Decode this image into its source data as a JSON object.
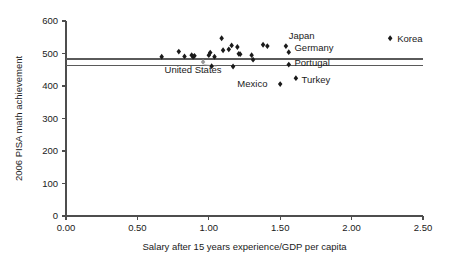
{
  "chart_data": {
    "type": "scatter",
    "title": "",
    "xlabel": "Salary after 15 years experience/GDP per capita",
    "ylabel": "2006 PISA math achievement",
    "xlim": [
      0.0,
      2.5
    ],
    "ylim": [
      0,
      600
    ],
    "grid": false,
    "legend_position": "top-right",
    "xticks": [
      "0.00",
      "0.50",
      "1.00",
      "1.50",
      "2.00",
      "2.50"
    ],
    "xtick_values": [
      0.0,
      0.5,
      1.0,
      1.5,
      2.0,
      2.5
    ],
    "yticks": [
      "0",
      "100",
      "200",
      "300",
      "400",
      "500",
      "600"
    ],
    "ytick_values": [
      0,
      100,
      200,
      300,
      400,
      500,
      600
    ],
    "legend": [
      {
        "name": "Korea",
        "x": 2.27,
        "y": 547
      }
    ],
    "reference_lines": [
      {
        "name": "oecd-average-upper",
        "value": 483
      },
      {
        "name": "oecd-average-lower",
        "value": 462
      }
    ],
    "points": [
      {
        "name": "point-1",
        "x": 0.67,
        "y": 490,
        "label": ""
      },
      {
        "name": "point-2",
        "x": 0.79,
        "y": 506,
        "label": ""
      },
      {
        "name": "point-3",
        "x": 0.83,
        "y": 491,
        "label": ""
      },
      {
        "name": "point-4",
        "x": 0.88,
        "y": 495,
        "label": ""
      },
      {
        "name": "point-5",
        "x": 0.89,
        "y": 490,
        "label": ""
      },
      {
        "name": "point-6",
        "x": 0.9,
        "y": 493,
        "label": ""
      },
      {
        "name": "point-7",
        "x": 0.96,
        "y": 474,
        "label": "United States",
        "highlight": true
      },
      {
        "name": "point-8",
        "x": 1.0,
        "y": 495,
        "label": ""
      },
      {
        "name": "point-9",
        "x": 1.01,
        "y": 503,
        "label": ""
      },
      {
        "name": "point-10",
        "x": 1.02,
        "y": 461,
        "label": ""
      },
      {
        "name": "point-11",
        "x": 1.04,
        "y": 490,
        "label": ""
      },
      {
        "name": "point-12",
        "x": 1.09,
        "y": 547,
        "label": ""
      },
      {
        "name": "point-13",
        "x": 1.1,
        "y": 510,
        "label": ""
      },
      {
        "name": "point-14",
        "x": 1.14,
        "y": 513,
        "label": ""
      },
      {
        "name": "point-15",
        "x": 1.16,
        "y": 525,
        "label": ""
      },
      {
        "name": "point-16",
        "x": 1.17,
        "y": 460,
        "label": ""
      },
      {
        "name": "point-17",
        "x": 1.2,
        "y": 520,
        "label": ""
      },
      {
        "name": "point-18",
        "x": 1.21,
        "y": 499,
        "label": ""
      },
      {
        "name": "point-19",
        "x": 1.22,
        "y": 498,
        "label": ""
      },
      {
        "name": "point-20",
        "x": 1.3,
        "y": 495,
        "label": ""
      },
      {
        "name": "point-21",
        "x": 1.31,
        "y": 481,
        "label": ""
      },
      {
        "name": "point-22",
        "x": 1.38,
        "y": 527,
        "label": ""
      },
      {
        "name": "point-23",
        "x": 1.41,
        "y": 523,
        "label": ""
      },
      {
        "name": "point-24",
        "x": 1.54,
        "y": 523,
        "label": "Japan"
      },
      {
        "name": "point-25",
        "x": 1.56,
        "y": 504,
        "label": "Germany"
      },
      {
        "name": "point-26",
        "x": 1.56,
        "y": 466,
        "label": "Portugal"
      },
      {
        "name": "point-27",
        "x": 1.5,
        "y": 406,
        "label": "Mexico"
      },
      {
        "name": "point-28",
        "x": 1.61,
        "y": 424,
        "label": "Turkey"
      }
    ],
    "annotations": [
      {
        "name": "label-japan",
        "text": "Japan",
        "x": 1.56,
        "y": 545
      },
      {
        "name": "label-germany",
        "text": "Germany",
        "x": 1.6,
        "y": 508
      },
      {
        "name": "label-portugal",
        "text": "Portugal",
        "x": 1.6,
        "y": 463
      },
      {
        "name": "label-turkey",
        "text": "Turkey",
        "x": 1.65,
        "y": 410
      },
      {
        "name": "label-mexico",
        "text": "Mexico",
        "x": 1.2,
        "y": 396
      },
      {
        "name": "label-united-states",
        "text": "United States",
        "x": 0.69,
        "y": 440
      }
    ]
  }
}
